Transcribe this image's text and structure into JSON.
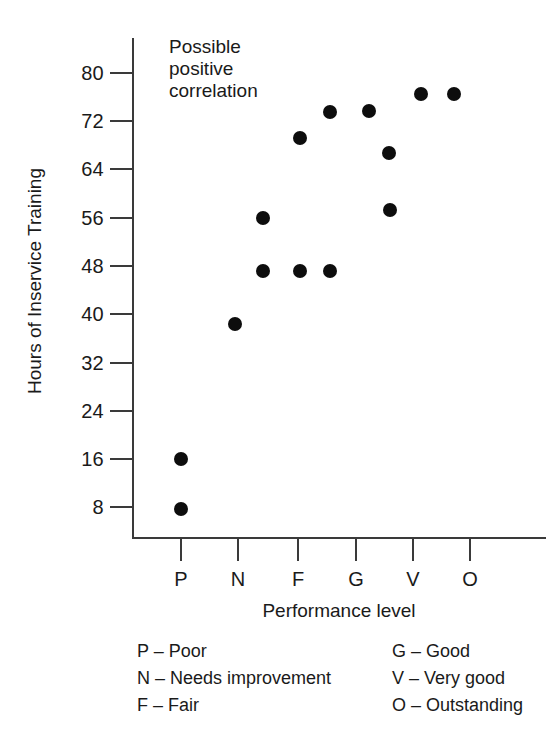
{
  "chart_data": {
    "type": "scatter",
    "title": "",
    "annotation": [
      "Possible",
      "positive",
      "correlation"
    ],
    "xlabel": "Performance level",
    "ylabel": "Hours of Inservice Training",
    "categories": [
      "P",
      "N",
      "F",
      "G",
      "V",
      "O"
    ],
    "category_labels": {
      "P": "Poor",
      "N": "Needs improvement",
      "F": "Fair",
      "G": "Good",
      "V": "Very good",
      "O": "Outstanding"
    },
    "xticklabels": [
      "P",
      "N",
      "F",
      "G",
      "V",
      "O"
    ],
    "yticklabels": [
      "80",
      "72",
      "64",
      "56",
      "48",
      "40",
      "32",
      "24",
      "16",
      "8"
    ],
    "yticks": [
      80,
      72,
      64,
      56,
      48,
      40,
      32,
      24,
      16,
      8
    ],
    "ylim": [
      0,
      84
    ],
    "grid": false,
    "legend": "none",
    "marker_color": "#0d0d0d",
    "axis_color": "#3a3a3a",
    "points": [
      {
        "x": "P",
        "x_pos": 0.0,
        "y": 16
      },
      {
        "x": "P",
        "x_pos": 0.0,
        "y": 8
      },
      {
        "x": "N",
        "x_pos": 1.0,
        "y": 39
      },
      {
        "x": "NF",
        "x_pos": 1.42,
        "y": 56
      },
      {
        "x": "NF",
        "x_pos": 1.42,
        "y": 47
      },
      {
        "x": "F",
        "x_pos": 2.06,
        "y": 47
      },
      {
        "x": "F",
        "x_pos": 2.05,
        "y": 69
      },
      {
        "x": "FG",
        "x_pos": 2.57,
        "y": 47
      },
      {
        "x": "FG",
        "x_pos": 2.59,
        "y": 74
      },
      {
        "x": "G",
        "x_pos": 3.22,
        "y": 74
      },
      {
        "x": "GV",
        "x_pos": 3.57,
        "y": 67
      },
      {
        "x": "GV",
        "x_pos": 3.58,
        "y": 58
      },
      {
        "x": "V",
        "x_pos": 4.13,
        "y": 77
      },
      {
        "x": "O",
        "x_pos": 5.1,
        "y": 77
      }
    ]
  },
  "axis": {
    "y_ticks": [
      {
        "label": "80",
        "value": 80,
        "top": 73
      },
      {
        "label": "72",
        "value": 72,
        "top": 121
      },
      {
        "label": "64",
        "value": 64,
        "top": 169
      },
      {
        "label": "56",
        "value": 56,
        "top": 218
      },
      {
        "label": "48",
        "value": 48,
        "top": 266
      },
      {
        "label": "40",
        "value": 40,
        "top": 314
      },
      {
        "label": "32",
        "value": 32,
        "top": 363
      },
      {
        "label": "24",
        "value": 24,
        "top": 411
      },
      {
        "label": "16",
        "value": 16,
        "top": 459
      },
      {
        "label": "8",
        "value": 8,
        "top": 507
      }
    ],
    "x_ticks": [
      {
        "label": "P",
        "left": 181
      },
      {
        "label": "N",
        "left": 238
      },
      {
        "label": "F",
        "left": 298
      },
      {
        "label": "G",
        "left": 356
      },
      {
        "label": "V",
        "left": 413
      },
      {
        "label": "O",
        "left": 470
      }
    ]
  },
  "points_px": [
    {
      "left": 181,
      "top": 459
    },
    {
      "left": 181,
      "top": 509
    },
    {
      "left": 235,
      "top": 324
    },
    {
      "left": 263,
      "top": 218
    },
    {
      "left": 263,
      "top": 271
    },
    {
      "left": 300,
      "top": 271
    },
    {
      "left": 300,
      "top": 138
    },
    {
      "left": 330,
      "top": 271
    },
    {
      "left": 330,
      "top": 112
    },
    {
      "left": 369,
      "top": 111
    },
    {
      "left": 389,
      "top": 153
    },
    {
      "left": 390,
      "top": 210
    },
    {
      "left": 421,
      "top": 94
    },
    {
      "left": 454,
      "top": 94
    }
  ],
  "annotation": {
    "line1": "Possible",
    "line2": "positive",
    "line3": "correlation"
  },
  "titles": {
    "x": "Performance level",
    "y": "Hours of Inservice Training"
  },
  "legend": {
    "rows": [
      {
        "left": "P – Poor",
        "right": "G – Good"
      },
      {
        "left": "N – Needs improvement",
        "right": "V – Very good"
      },
      {
        "left": "F – Fair",
        "right": "O – Outstanding"
      }
    ]
  }
}
